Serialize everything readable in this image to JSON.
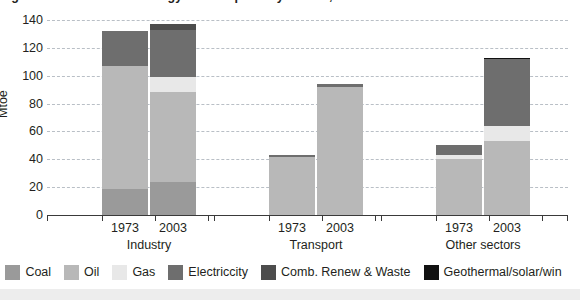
{
  "title_clipped": "Figure 1: Sectoral final energy consumption by source, 1973 and 2003",
  "axis": {
    "ylabel": "Mtoe",
    "yticks": [
      0,
      20,
      40,
      60,
      80,
      100,
      120,
      140
    ],
    "ymin": 0,
    "ymax": 140
  },
  "groups": [
    {
      "name": "Industry",
      "years": [
        "1973",
        "2003"
      ]
    },
    {
      "name": "Transport",
      "years": [
        "1973",
        "2003"
      ]
    },
    {
      "name": "Other sectors",
      "years": [
        "1973",
        "2003"
      ]
    }
  ],
  "legend": [
    {
      "label": "Coal",
      "color": "#9a9a9a"
    },
    {
      "label": "Oil",
      "color": "#b8b8b8"
    },
    {
      "label": "Gas",
      "color": "#e8e8e8"
    },
    {
      "label": "Electriccity",
      "color": "#6e6e6e"
    },
    {
      "label": "Comb. Renew & Waste",
      "color": "#4d4d4d"
    },
    {
      "label": "Geothermal/solar/win",
      "color": "#111111"
    }
  ],
  "colors": {
    "coal": "#9a9a9a",
    "oil": "#b8b8b8",
    "gas": "#e8e8e8",
    "electricity": "#6e6e6e",
    "comb_renew_waste": "#4d4d4d",
    "geothermal_solar_wind": "#111111",
    "gridline": "#b9bfc6",
    "axis": "#3a3a3a",
    "text": "#231f20",
    "background": "#ffffff"
  },
  "chart_data": {
    "type": "bar",
    "title": "Figure 1: Sectoral final energy consumption by source, 1973 and 2003",
    "xlabel": "",
    "ylabel": "Mtoe",
    "ylim": [
      0,
      140
    ],
    "ytick_step": 20,
    "grid": true,
    "stacked": true,
    "legend_position": "bottom",
    "categories": [
      "Industry 1973",
      "Industry 2003",
      "Transport 1973",
      "Transport 2003",
      "Other sectors 1973",
      "Other sectors 2003"
    ],
    "group_labels": [
      "Industry",
      "Transport",
      "Other sectors"
    ],
    "year_labels": [
      "1973",
      "2003",
      "1973",
      "2003",
      "1973",
      "2003"
    ],
    "series": [
      {
        "name": "Coal",
        "color": "#9a9a9a",
        "values": [
          19,
          24,
          0,
          0,
          0,
          0
        ]
      },
      {
        "name": "Oil",
        "color": "#b8b8b8",
        "values": [
          88,
          64,
          42,
          92,
          40,
          53
        ]
      },
      {
        "name": "Gas",
        "color": "#e8e8e8",
        "values": [
          0,
          11,
          0,
          0,
          3,
          11
        ]
      },
      {
        "name": "Electriccity",
        "color": "#6e6e6e",
        "values": [
          25,
          34,
          1,
          2,
          7,
          48
        ]
      },
      {
        "name": "Comb. Renew & Waste",
        "color": "#4d4d4d",
        "values": [
          0,
          4,
          0,
          0,
          0,
          0
        ]
      },
      {
        "name": "Geothermal/solar/win",
        "color": "#111111",
        "values": [
          0,
          0,
          0,
          0,
          0,
          1
        ]
      }
    ],
    "totals": [
      132,
      137,
      43,
      94,
      50,
      113
    ]
  }
}
